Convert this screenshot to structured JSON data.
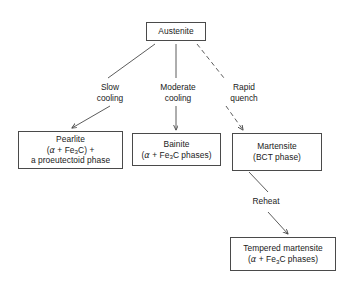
{
  "diagram": {
    "background_color": "#ffffff",
    "line_color": "#4a4a4a",
    "text_color": "#1a1a1a"
  },
  "nodes": {
    "austenite": {
      "name": "Austenite",
      "lines": [
        "Austenite"
      ]
    },
    "pearlite": {
      "name": "Pearlite",
      "line1": "Pearlite",
      "line2_pre": "(",
      "line2_alpha": "α",
      "line2_mid": " + Fe",
      "line2_sub": "3",
      "line2_post": "C) +",
      "line3": "a proeutectoid phase"
    },
    "bainite": {
      "name": "Bainite",
      "line1": "Bainite",
      "line2_pre": "(",
      "line2_alpha": "α",
      "line2_mid": " + Fe",
      "line2_sub": "3",
      "line2_post": "C phases)"
    },
    "martensite": {
      "name": "Martensite",
      "line1": "Martensite",
      "line2": "(BCT phase)"
    },
    "tempered_martensite": {
      "name": "Tempered martensite",
      "line1": "Tempered martensite",
      "line2_pre": "(",
      "line2_alpha": "α",
      "line2_mid": " + Fe",
      "line2_sub": "3",
      "line2_post": "C phases)"
    }
  },
  "edges": {
    "slow_cooling": {
      "line1": "Slow",
      "line2": "cooling",
      "style": "solid",
      "from": "austenite",
      "to": "pearlite"
    },
    "moderate_cooling": {
      "line1": "Moderate",
      "line2": "cooling",
      "style": "solid",
      "from": "austenite",
      "to": "bainite"
    },
    "rapid_quench": {
      "line1": "Rapid",
      "line2": "quench",
      "style": "dashed",
      "from": "austenite",
      "to": "martensite"
    },
    "reheat": {
      "line1": "Reheat",
      "style": "solid",
      "from": "martensite",
      "to": "tempered_martensite"
    }
  }
}
